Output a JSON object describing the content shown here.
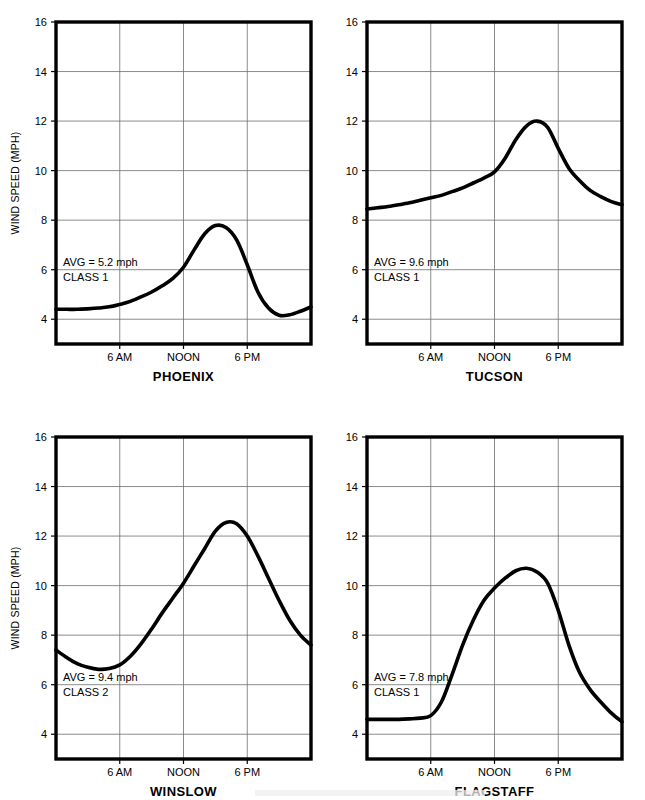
{
  "figure": {
    "y_axis_title": "WIND SPEED (MPH)",
    "y_ticks": [
      "16",
      "14",
      "12",
      "10",
      "8",
      "6",
      "4"
    ],
    "x_ticks": [
      "6 AM",
      "NOON",
      "6 PM"
    ]
  },
  "chart_data": [
    {
      "type": "line",
      "title": "PHOENIX",
      "xlabel": "",
      "ylabel": "WIND SPEED (MPH)",
      "ylim": [
        3,
        16
      ],
      "xlim": [
        0,
        24
      ],
      "y_tick_values": [
        4,
        6,
        8,
        10,
        12,
        14,
        16
      ],
      "x_tick_values": [
        6,
        12,
        18
      ],
      "x_tick_labels": [
        "6 AM",
        "NOON",
        "6 PM"
      ],
      "grid": true,
      "legend": "none",
      "annotations": [
        "AVG = 5.2 mph",
        "CLASS 1"
      ],
      "average_mph": 5.2,
      "wind_class": 1,
      "x": [
        0,
        1,
        2,
        3,
        4,
        5,
        6,
        7,
        8,
        9,
        10,
        11,
        12,
        13,
        14,
        15,
        16,
        17,
        18,
        19,
        20,
        21,
        22,
        23,
        24
      ],
      "values": [
        4.4,
        4.4,
        4.4,
        4.42,
        4.45,
        4.5,
        4.6,
        4.72,
        4.9,
        5.1,
        5.35,
        5.65,
        6.1,
        6.8,
        7.45,
        7.78,
        7.7,
        7.2,
        6.2,
        5.1,
        4.45,
        4.16,
        4.18,
        4.32,
        4.5
      ]
    },
    {
      "type": "line",
      "title": "TUCSON",
      "xlabel": "",
      "ylabel": "",
      "ylim": [
        3,
        16
      ],
      "xlim": [
        0,
        24
      ],
      "y_tick_values": [
        4,
        6,
        8,
        10,
        12,
        14,
        16
      ],
      "x_tick_values": [
        6,
        12,
        18
      ],
      "x_tick_labels": [
        "6 AM",
        "NOON",
        "6 PM"
      ],
      "grid": true,
      "legend": "none",
      "annotations": [
        "AVG = 9.6 mph",
        "CLASS 1"
      ],
      "average_mph": 9.6,
      "wind_class": 1,
      "x": [
        0,
        1,
        2,
        3,
        4,
        5,
        6,
        7,
        8,
        9,
        10,
        11,
        12,
        13,
        14,
        15,
        16,
        17,
        18,
        19,
        20,
        21,
        22,
        23,
        24
      ],
      "values": [
        8.45,
        8.5,
        8.55,
        8.62,
        8.7,
        8.8,
        8.9,
        9.0,
        9.15,
        9.3,
        9.5,
        9.7,
        9.95,
        10.5,
        11.25,
        11.8,
        12.0,
        11.75,
        10.9,
        10.1,
        9.6,
        9.2,
        8.95,
        8.75,
        8.62
      ]
    },
    {
      "type": "line",
      "title": "WINSLOW",
      "xlabel": "",
      "ylabel": "WIND SPEED (MPH)",
      "ylim": [
        3,
        16
      ],
      "xlim": [
        0,
        24
      ],
      "y_tick_values": [
        4,
        6,
        8,
        10,
        12,
        14,
        16
      ],
      "x_tick_values": [
        6,
        12,
        18
      ],
      "x_tick_labels": [
        "6 AM",
        "NOON",
        "6 PM"
      ],
      "grid": true,
      "legend": "none",
      "annotations": [
        "AVG = 9.4 mph",
        "CLASS 2"
      ],
      "average_mph": 9.4,
      "wind_class": 2,
      "x": [
        0,
        1,
        2,
        3,
        4,
        5,
        6,
        7,
        8,
        9,
        10,
        11,
        12,
        13,
        14,
        15,
        16,
        17,
        18,
        19,
        20,
        21,
        22,
        23,
        24
      ],
      "values": [
        7.4,
        7.1,
        6.85,
        6.7,
        6.62,
        6.65,
        6.8,
        7.15,
        7.65,
        8.25,
        8.9,
        9.5,
        10.1,
        10.8,
        11.5,
        12.2,
        12.55,
        12.5,
        12.0,
        11.2,
        10.3,
        9.4,
        8.6,
        8.0,
        7.6
      ]
    },
    {
      "type": "line",
      "title": "FLAGSTAFF",
      "xlabel": "",
      "ylabel": "",
      "ylim": [
        3,
        16
      ],
      "xlim": [
        0,
        24
      ],
      "y_tick_values": [
        4,
        6,
        8,
        10,
        12,
        14,
        16
      ],
      "x_tick_values": [
        6,
        12,
        18
      ],
      "x_tick_labels": [
        "6 AM",
        "NOON",
        "6 PM"
      ],
      "grid": true,
      "legend": "none",
      "annotations": [
        "AVG = 7.8 mph",
        "CLASS 1"
      ],
      "average_mph": 7.8,
      "wind_class": 1,
      "x": [
        0,
        1,
        2,
        3,
        4,
        5,
        6,
        7,
        8,
        9,
        10,
        11,
        12,
        13,
        14,
        15,
        16,
        17,
        18,
        19,
        20,
        21,
        22,
        23,
        24
      ],
      "values": [
        4.6,
        4.6,
        4.6,
        4.6,
        4.62,
        4.65,
        4.75,
        5.3,
        6.4,
        7.6,
        8.6,
        9.4,
        9.9,
        10.3,
        10.6,
        10.7,
        10.55,
        10.1,
        9.0,
        7.6,
        6.5,
        5.8,
        5.3,
        4.85,
        4.5
      ]
    }
  ]
}
